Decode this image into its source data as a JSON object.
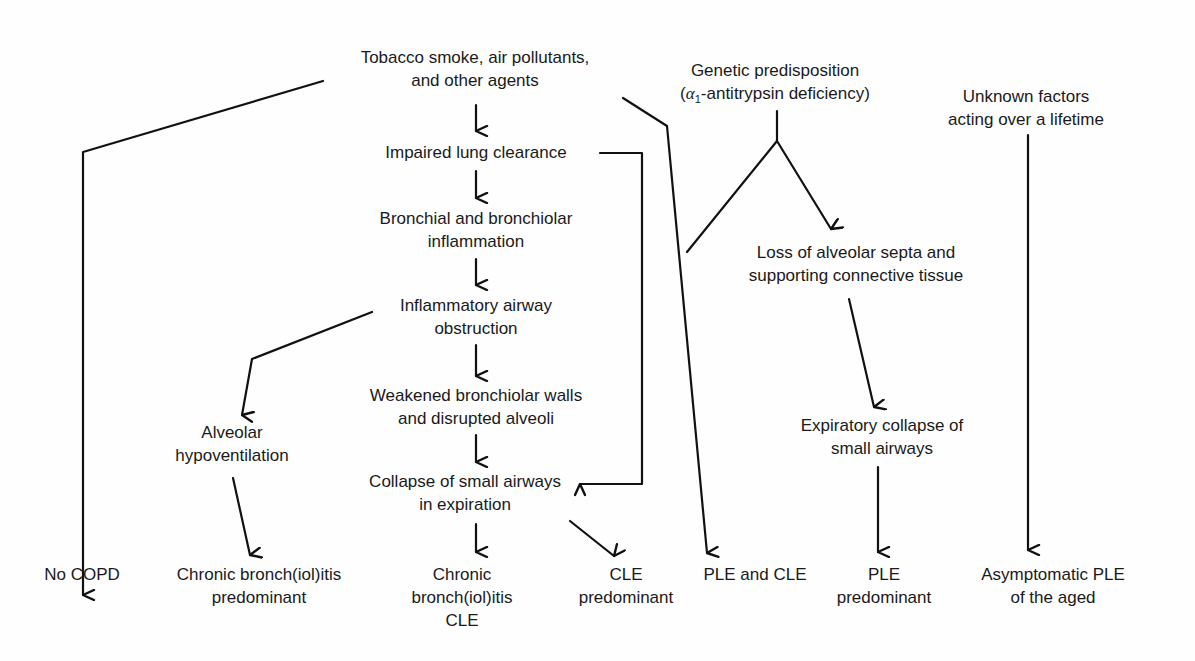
{
  "nodes": {
    "tobacco": {
      "line1": "Tobacco smoke, air pollutants,",
      "line2": "and other agents"
    },
    "genetic": {
      "line1": "Genetic predisposition",
      "line2_prefix": "(",
      "alpha": "α",
      "alpha_sub": "1",
      "line2_rest": "-antitrypsin deficiency)"
    },
    "unknown": {
      "line1": "Unknown factors",
      "line2": "acting over a lifetime"
    },
    "impaired": {
      "line1": "Impaired lung clearance"
    },
    "bronchial": {
      "line1": "Bronchial and bronchiolar",
      "line2": "inflammation"
    },
    "inflammatory": {
      "line1": "Inflammatory airway",
      "line2": "obstruction"
    },
    "loss_septa": {
      "line1": "Loss of alveolar septa and",
      "line2": "supporting connective tissue"
    },
    "weakened": {
      "line1": "Weakened bronchiolar walls",
      "line2": "and disrupted alveoli"
    },
    "alveolar_hypo": {
      "line1": "Alveolar",
      "line2": "hypoventilation"
    },
    "collapse": {
      "line1": "Collapse of small airways",
      "line2": "in expiration"
    },
    "expiratory": {
      "line1": "Expiratory collapse of",
      "line2": "small airways"
    }
  },
  "outcomes": [
    {
      "id": "no-copd",
      "line1": "No COPD"
    },
    {
      "id": "chronic-bronch-predominant",
      "line1": "Chronic bronch(iol)itis",
      "line2": "predominant"
    },
    {
      "id": "chronic-bronch-cle",
      "line1": "Chronic",
      "line2": "bronch(iol)itis",
      "line3": "CLE"
    },
    {
      "id": "cle-predominant",
      "line1": "CLE",
      "line2": "predominant"
    },
    {
      "id": "ple-and-cle",
      "line1": "PLE and CLE"
    },
    {
      "id": "ple-predominant",
      "line1": "PLE",
      "line2": "predominant"
    },
    {
      "id": "asymptomatic-ple",
      "line1": "Asymptomatic PLE",
      "line2": "of the aged"
    }
  ],
  "colors": {
    "ink": "#111111",
    "background": "#fefefe"
  }
}
